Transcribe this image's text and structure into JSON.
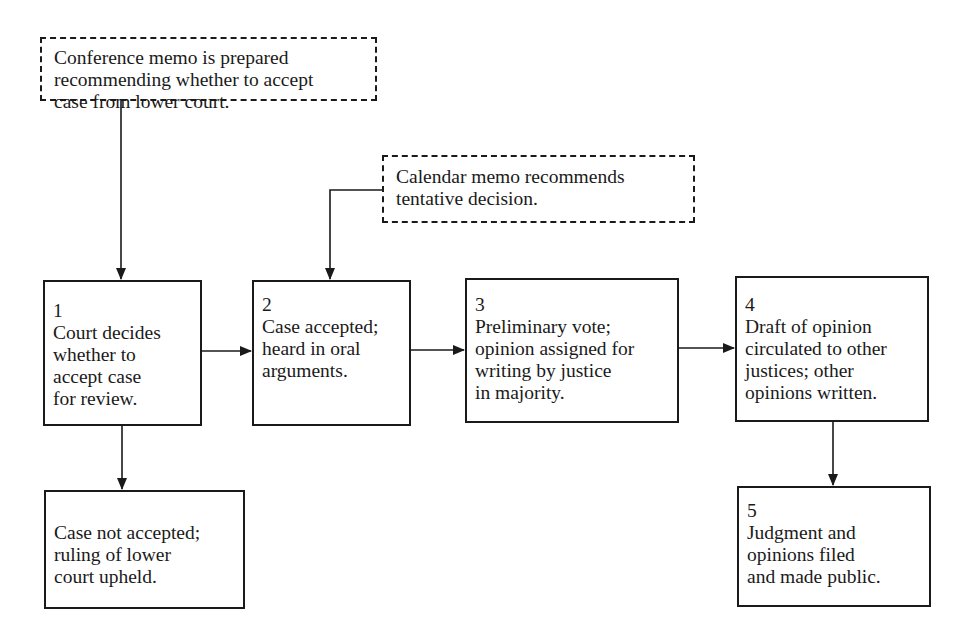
{
  "diagram": {
    "type": "flowchart",
    "notes": [
      {
        "id": "conference-memo",
        "style": "dashed",
        "text": "Conference memo is prepared\nrecommending whether to accept\ncase from lower court."
      },
      {
        "id": "calendar-memo",
        "style": "dashed",
        "text": "Calendar memo recommends\ntentative decision."
      }
    ],
    "steps": [
      {
        "id": "step-1",
        "number": "1",
        "text": "Court decides\nwhether to\naccept case\nfor review."
      },
      {
        "id": "step-2",
        "number": "2",
        "text": "Case accepted;\nheard in oral\narguments."
      },
      {
        "id": "step-3",
        "number": "3",
        "text": "Preliminary vote;\nopinion assigned for\nwriting by justice\nin majority."
      },
      {
        "id": "step-4",
        "number": "4",
        "text": "Draft of opinion\ncirculated to other\njustices; other\nopinions written."
      },
      {
        "id": "step-5",
        "number": "5",
        "text": "Judgment and\nopinions filed\nand made public."
      }
    ],
    "outcome": {
      "id": "not-accepted",
      "text": "Case not accepted;\nruling of lower\ncourt upheld."
    },
    "edges": [
      {
        "from": "conference-memo",
        "to": "step-1"
      },
      {
        "from": "calendar-memo",
        "to": "step-2"
      },
      {
        "from": "step-1",
        "to": "step-2"
      },
      {
        "from": "step-1",
        "to": "not-accepted"
      },
      {
        "from": "step-2",
        "to": "step-3"
      },
      {
        "from": "step-3",
        "to": "step-4"
      },
      {
        "from": "step-4",
        "to": "step-5"
      }
    ],
    "colors": {
      "line": "#1a1a1a",
      "background": "#ffffff"
    }
  }
}
